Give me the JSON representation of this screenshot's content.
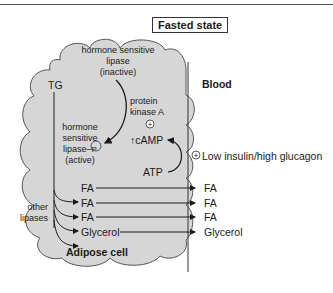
{
  "title": "Fasted state",
  "compartments": {
    "cell_label": "Adipose cell",
    "blood_label": "Blood"
  },
  "cell": {
    "tg": "TG",
    "hsl_inactive": [
      "hormone sensitive",
      "lipase",
      "(inactive)"
    ],
    "hsl_active": [
      "hormone",
      "sensitive",
      "lipase–",
      "(active)"
    ],
    "phospho_symbol": "P",
    "pka": [
      "protein",
      "kinase A"
    ],
    "plus_symbol": "+",
    "camp": "cAMP",
    "camp_up_arrow": "↑",
    "atp": "ATP",
    "other_lipases": [
      "other",
      "lipases"
    ],
    "products": [
      "FA",
      "FA",
      "FA",
      "Glycerol"
    ]
  },
  "blood": {
    "signal": "Low insulin/high glucagon",
    "products": [
      "FA",
      "FA",
      "FA",
      "Glycerol"
    ]
  },
  "colors": {
    "cell_fill": "#d6d6d6",
    "cell_stroke": "#555555",
    "line": "#1a1a1a"
  }
}
